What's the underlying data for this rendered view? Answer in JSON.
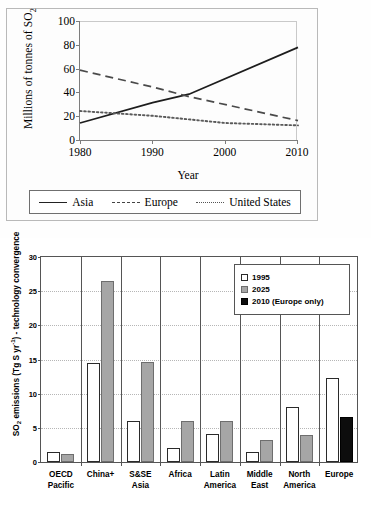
{
  "chart_data": [
    {
      "type": "line",
      "id": "so2-trend-line",
      "ylabel": "Millions of tonnes of SO",
      "ylabel_sub": "2",
      "xlabel": "Year",
      "x": [
        1980,
        1990,
        2000,
        2010
      ],
      "xlim": [
        1980,
        2010
      ],
      "ylim": [
        0,
        100
      ],
      "yticks": [
        0,
        20,
        40,
        60,
        80,
        100
      ],
      "xticks": [
        "1980",
        "1990",
        "2000",
        "2010"
      ],
      "grid": false,
      "legend_position": "below-plot",
      "series": [
        {
          "name": "Asia",
          "style": "solid",
          "x": [
            1980,
            1990,
            1995,
            2010
          ],
          "values": [
            15,
            32,
            39,
            78
          ]
        },
        {
          "name": "Europe",
          "style": "dashed",
          "x": [
            1980,
            1990,
            1995,
            2010
          ],
          "values": [
            59,
            45,
            37,
            17
          ]
        },
        {
          "name": "United States",
          "style": "dotted",
          "x": [
            1980,
            1985,
            1990,
            2000,
            2010
          ],
          "values": [
            25,
            23,
            21,
            15,
            13
          ]
        }
      ]
    },
    {
      "type": "bar",
      "id": "so2-emissions-regions",
      "ylabel_main": "SO",
      "ylabel_sub": "2",
      "ylabel_rest": " emissions (Tg S yr",
      "ylabel_sup": "-1",
      "ylabel_tail": ") - technology convergence",
      "ylim": [
        0,
        30
      ],
      "yticks": [
        0,
        5,
        10,
        15,
        20,
        25,
        30
      ],
      "grid": true,
      "legend_position": "top-right",
      "categories": [
        "OECD\nPacific",
        "China+",
        "S&SE\nAsia",
        "Africa",
        "Latin\nAmerica",
        "Middle\nEast",
        "North\nAmerica",
        "Europe"
      ],
      "category_lines": [
        [
          "OECD",
          "Pacific"
        ],
        [
          "China+",
          ""
        ],
        [
          "S&SE",
          "Asia"
        ],
        [
          "Africa",
          ""
        ],
        [
          "Latin",
          "America"
        ],
        [
          "Middle",
          "East"
        ],
        [
          "North",
          "America"
        ],
        [
          "Europe",
          ""
        ]
      ],
      "series": [
        {
          "name": "1995",
          "color": "#ffffff",
          "values": [
            1.5,
            14.3,
            6.0,
            2.0,
            4.0,
            1.5,
            8.0,
            12.2
          ]
        },
        {
          "name": "2025",
          "color": "#a6a6a6",
          "values": [
            1.2,
            26.3,
            14.5,
            6.0,
            6.0,
            3.2,
            3.9,
            null
          ]
        },
        {
          "name": "2010 (Europe only)",
          "color": "#0d0d0d",
          "values": [
            null,
            null,
            null,
            null,
            null,
            null,
            null,
            6.6
          ]
        }
      ]
    }
  ],
  "line_chart": {
    "ylabel": "Millions of tonnes of SO",
    "ylabel_sub": "2",
    "xlabel": "Year",
    "yticks": [
      "0",
      "20",
      "40",
      "60",
      "80",
      "100"
    ],
    "xticks": [
      "1980",
      "1990",
      "2000",
      "2010"
    ],
    "legend": [
      {
        "label": "Asia",
        "style": "solid"
      },
      {
        "label": "Europe",
        "style": "dashed"
      },
      {
        "label": "United States",
        "style": "dotted"
      }
    ]
  },
  "bar_chart": {
    "ylabel_main": "SO",
    "ylabel_sub": "2",
    "ylabel_rest": " emissions (Tg S yr",
    "ylabel_sup": "-1",
    "ylabel_tail": ") - technology convergence",
    "yticks": [
      "0",
      "5",
      "10",
      "15",
      "20",
      "25",
      "30"
    ],
    "legend": [
      {
        "label": "1995",
        "key": "k1995"
      },
      {
        "label": "2025",
        "key": "k2025"
      },
      {
        "label": "2010 (Europe only)",
        "key": "k2010"
      }
    ],
    "xticks": [
      {
        "l1": "OECD",
        "l2": "Pacific"
      },
      {
        "l1": "China+",
        "l2": ""
      },
      {
        "l1": "S&SE",
        "l2": "Asia"
      },
      {
        "l1": "Africa",
        "l2": ""
      },
      {
        "l1": "Latin",
        "l2": "America"
      },
      {
        "l1": "Middle",
        "l2": "East"
      },
      {
        "l1": "North",
        "l2": "America"
      },
      {
        "l1": "Europe",
        "l2": ""
      }
    ]
  }
}
